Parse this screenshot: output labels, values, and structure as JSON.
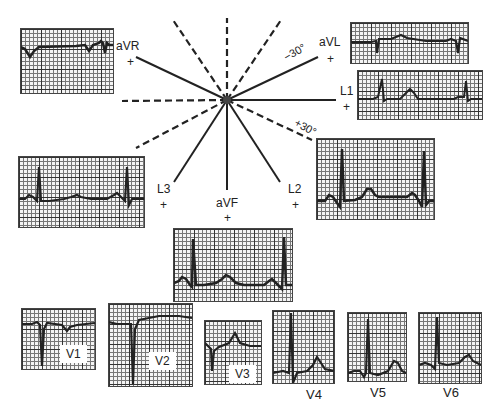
{
  "figure": {
    "colors": {
      "ink": "#222222",
      "grid_major": "#333333",
      "grid_minor": "#777777",
      "paper": "#f4f4f4"
    },
    "hexaxial": {
      "center": [
        227,
        100
      ],
      "solid_axes": [
        "aVR",
        "aVL",
        "L1",
        "L2",
        "aVF",
        "L3"
      ],
      "dashed_axes": [
        "negative aVR",
        "negative aVL",
        "negative L1",
        "negative L2",
        "negative aVF",
        "negative L3"
      ],
      "angle_labels": {
        "minus30": "−30°",
        "plus30": "+30°"
      }
    },
    "limb_leads": [
      {
        "name": "aVR",
        "label": "aVR",
        "polarity": "+"
      },
      {
        "name": "aVL",
        "label": "aVL",
        "polarity": "+"
      },
      {
        "name": "L1",
        "label": "L1",
        "polarity": "+"
      },
      {
        "name": "L2",
        "label": "L2",
        "polarity": "+"
      },
      {
        "name": "aVF",
        "label": "aVF",
        "polarity": "+"
      },
      {
        "name": "L3",
        "label": "L3",
        "polarity": "+"
      }
    ],
    "precordial_leads": [
      {
        "name": "V1",
        "label": "V1"
      },
      {
        "name": "V2",
        "label": "V2"
      },
      {
        "name": "V3",
        "label": "V3"
      },
      {
        "name": "V4",
        "label": "V4"
      },
      {
        "name": "V5",
        "label": "V5"
      },
      {
        "name": "V6",
        "label": "V6"
      }
    ]
  }
}
